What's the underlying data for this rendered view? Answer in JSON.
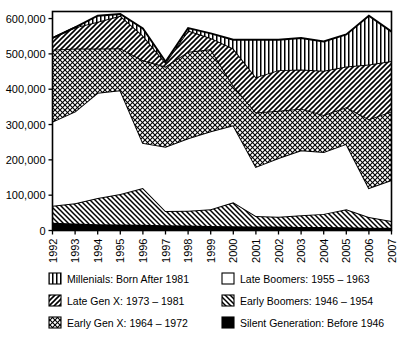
{
  "chart_data": {
    "type": "area",
    "stacked": true,
    "title": "",
    "subtitle": "",
    "xlabel": "",
    "ylabel": "",
    "grid": false,
    "legend_position": "bottom",
    "categories": [
      "1992",
      "1993",
      "1994",
      "1995",
      "1996",
      "1997",
      "1998",
      "1999",
      "2000",
      "2001",
      "2002",
      "2003",
      "2004",
      "2005",
      "2006",
      "2007"
    ],
    "x": [
      1992,
      1993,
      1994,
      1995,
      1996,
      1997,
      1998,
      1999,
      2000,
      2001,
      2002,
      2003,
      2004,
      2005,
      2006,
      2007
    ],
    "xlim": [
      1992,
      2007
    ],
    "ylim": [
      0,
      620000
    ],
    "ytick_labels": [
      "0",
      "100,000",
      "200,000",
      "300,000",
      "400,000",
      "500,000",
      "600,000"
    ],
    "ytick_values": [
      0,
      100000,
      200000,
      300000,
      400000,
      500000,
      600000
    ],
    "series": [
      {
        "name": "Silent Generation:  Before 1946",
        "pattern": "solid-black",
        "values": [
          22000,
          20000,
          18000,
          17000,
          16000,
          15000,
          14000,
          13000,
          12000,
          11000,
          11000,
          10000,
          10000,
          9000,
          8000,
          8000
        ]
      },
      {
        "name": "Early Boomers:  1946 - 1954",
        "pattern": "forward-slash-hatch",
        "values": [
          48000,
          57000,
          74000,
          86000,
          104000,
          40000,
          42000,
          47000,
          68000,
          30000,
          28000,
          33000,
          37000,
          51000,
          30000,
          19000
        ]
      },
      {
        "name": "Late Boomers:  1955 - 1963",
        "pattern": "white",
        "values": [
          238000,
          260000,
          298000,
          294000,
          128000,
          182000,
          205000,
          221000,
          218000,
          139000,
          166000,
          184000,
          175000,
          185000,
          82000,
          116000
        ]
      },
      {
        "name": "Early Gen X: 1964 - 1972",
        "pattern": "crosshatch",
        "values": [
          204000,
          178000,
          125000,
          119000,
          234000,
          227000,
          245000,
          232000,
          112000,
          154000,
          134000,
          118000,
          105000,
          104000,
          195000,
          194000
        ]
      },
      {
        "name": "Late Gen X: 1973 - 1981",
        "pattern": "back-slash-hatch",
        "values": [
          33000,
          60000,
          76000,
          92000,
          70000,
          11000,
          60000,
          32000,
          105000,
          100000,
          115000,
          111000,
          125000,
          115000,
          155000,
          143000
        ]
      },
      {
        "name": "Millenials: Born After 1981",
        "pattern": "vertical-stripes",
        "values": [
          0,
          0,
          17000,
          5000,
          20000,
          3000,
          7000,
          13000,
          25000,
          106000,
          86000,
          89000,
          83000,
          91000,
          138000,
          83000
        ]
      }
    ],
    "stack_tops": {
      "silent": [
        22000,
        20000,
        18000,
        17000,
        16000,
        15000,
        14000,
        13000,
        12000,
        11000,
        11000,
        10000,
        10000,
        9000,
        8000,
        8000
      ],
      "early_boomers": [
        70000,
        77000,
        92000,
        103000,
        120000,
        55000,
        56000,
        60000,
        80000,
        41000,
        39000,
        43000,
        47000,
        60000,
        38000,
        27000
      ],
      "late_boomers": [
        308000,
        337000,
        390000,
        397000,
        248000,
        237000,
        261000,
        281000,
        298000,
        180000,
        205000,
        227000,
        222000,
        245000,
        120000,
        143000
      ],
      "early_genx": [
        512000,
        515000,
        515000,
        516000,
        482000,
        464000,
        506000,
        513000,
        410000,
        334000,
        339000,
        345000,
        327000,
        349000,
        315000,
        337000
      ],
      "late_genx": [
        545000,
        575000,
        591000,
        608000,
        552000,
        475000,
        566000,
        545000,
        515000,
        434000,
        454000,
        456000,
        452000,
        464000,
        470000,
        480000
      ],
      "millenials": [
        545000,
        575000,
        608000,
        613000,
        572000,
        478000,
        573000,
        558000,
        540000,
        540000,
        540000,
        545000,
        535000,
        555000,
        608000,
        563000
      ]
    }
  },
  "legend": {
    "items": [
      {
        "label": "Millenials: Born After 1981",
        "swatch": "vertical-stripes"
      },
      {
        "label": "Late Boomers:  1955 – 1963",
        "swatch": "white"
      },
      {
        "label": "Late Gen X: 1973 – 1981",
        "swatch": "back-slash-hatch"
      },
      {
        "label": "Early Boomers:  1946 – 1954",
        "swatch": "forward-slash-hatch"
      },
      {
        "label": "Early Gen X: 1964 – 1972",
        "swatch": "crosshatch"
      },
      {
        "label": "Silent Generation:  Before 1946",
        "swatch": "solid-black"
      }
    ]
  },
  "colors": {
    "ink": "#000000",
    "background": "#ffffff"
  }
}
